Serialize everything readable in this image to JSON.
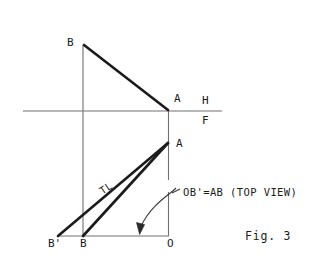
{
  "figure": {
    "caption": "Fig. 3",
    "note": "OB'=AB (TOP VIEW)",
    "true_length_label": "TL",
    "reference_line": {
      "above_label": "H",
      "below_label": "F"
    },
    "points": [
      {
        "id": "b-front",
        "label": "B",
        "x": 83,
        "y": 45
      },
      {
        "id": "a-front",
        "label": "A",
        "x": 168,
        "y": 110
      },
      {
        "id": "a-top",
        "label": "A",
        "x": 168,
        "y": 143
      },
      {
        "id": "b-prime",
        "label": "B'",
        "x": 58,
        "y": 236
      },
      {
        "id": "b-top",
        "label": "B",
        "x": 83,
        "y": 236
      },
      {
        "id": "o-origin",
        "label": "O",
        "x": 169,
        "y": 236
      }
    ],
    "colors": {
      "ink": "#1b1b1b",
      "thin_line": "#6f6f6f",
      "paper": "#ffffff"
    }
  },
  "labels": {
    "b_front": "B",
    "a_front": "A",
    "a_top": "A",
    "b_prime": "B'",
    "b_top": "B",
    "o": "O",
    "h": "H",
    "f": "F",
    "tl": "TL",
    "note": "OB'=AB (TOP VIEW)",
    "fig": "Fig. 3"
  }
}
